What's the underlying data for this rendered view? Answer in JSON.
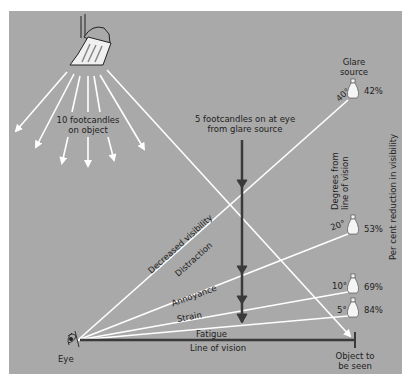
{
  "diagram": {
    "lamp_label": [
      "10 footcandles",
      "on object"
    ],
    "glare_label": [
      "5 footcandles on at eye",
      "from glare source"
    ],
    "glare_source_label": [
      "Glare",
      "source"
    ],
    "eye_label": "Eye",
    "line_of_vision_label": "Line of vision",
    "object_label": [
      "Object to",
      "be seen"
    ],
    "degrees_axis_label": [
      "Degrees from",
      "line of vision"
    ],
    "reduction_axis_label": "Per cent reduction in visibility",
    "effects": [
      "Decreased visibility",
      "Distraction",
      "Annoyance",
      "Strain",
      "Fatigue"
    ],
    "glare_positions": [
      {
        "angle": "40°",
        "reduction": "42%"
      },
      {
        "angle": "20°",
        "reduction": "53%"
      },
      {
        "angle": "10°",
        "reduction": "69%"
      },
      {
        "angle": "5°",
        "reduction": "84%"
      }
    ],
    "colors": {
      "background": "#a9a9a9",
      "rays": "#ffffff",
      "dark_arrow": "#3a3a3a",
      "text": "#1e1e1e"
    }
  }
}
